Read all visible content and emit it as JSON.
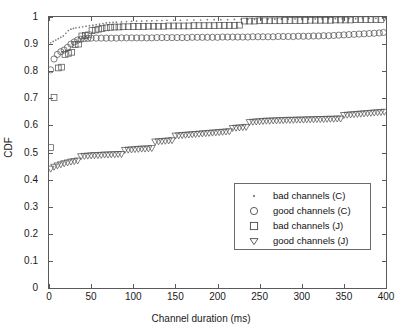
{
  "chart_data": {
    "type": "scatter",
    "title": "",
    "xlabel": "Channel duration (ms)",
    "ylabel": "CDF",
    "xlim": [
      0,
      400
    ],
    "ylim": [
      0,
      1
    ],
    "xticks": [
      0,
      50,
      100,
      150,
      200,
      250,
      300,
      350,
      400
    ],
    "yticks": [
      0,
      0.1,
      0.2,
      0.3,
      0.4,
      0.5,
      0.6,
      0.7,
      0.8,
      0.9,
      1
    ],
    "xtick_labels": [
      "0",
      "50",
      "100",
      "150",
      "200",
      "250",
      "300",
      "350",
      "400"
    ],
    "ytick_labels": [
      "0",
      "0.1",
      "0.2",
      "0.3",
      "0.4",
      "0.5",
      "0.6",
      "0.7",
      "0.8",
      "0.9",
      "1"
    ],
    "grid": false,
    "legend_position": "lower right",
    "series": [
      {
        "name": "bad channels (C)",
        "marker": "dot",
        "color": "#7a7a7a",
        "x": [
          2,
          5,
          8,
          11,
          14,
          17,
          20,
          23,
          26,
          29,
          32,
          36,
          40,
          44,
          48,
          52,
          56,
          60,
          64,
          68,
          72,
          76,
          80,
          86,
          92,
          98,
          104,
          110,
          116,
          122,
          128,
          134,
          140,
          148,
          156,
          164,
          172,
          180,
          188,
          196,
          204,
          212,
          220,
          228,
          236,
          244,
          252,
          260,
          268,
          276,
          284,
          292,
          300,
          308,
          316,
          324,
          332,
          340,
          348,
          356,
          364,
          372,
          380,
          388,
          396
        ],
        "y": [
          0.905,
          0.91,
          0.915,
          0.92,
          0.925,
          0.93,
          0.94,
          0.95,
          0.955,
          0.958,
          0.96,
          0.962,
          0.964,
          0.966,
          0.968,
          0.97,
          0.972,
          0.974,
          0.976,
          0.978,
          0.979,
          0.98,
          0.981,
          0.982,
          0.983,
          0.984,
          0.985,
          0.985,
          0.986,
          0.986,
          0.987,
          0.987,
          0.988,
          0.988,
          0.988,
          0.989,
          0.989,
          0.989,
          0.99,
          0.99,
          0.99,
          0.99,
          0.991,
          0.991,
          0.991,
          0.991,
          0.992,
          0.992,
          0.992,
          0.992,
          0.992,
          0.993,
          0.993,
          0.993,
          0.993,
          0.993,
          0.994,
          0.994,
          0.994,
          0.994,
          0.994,
          0.995,
          0.995,
          0.995,
          0.996
        ]
      },
      {
        "name": "good channels (C)",
        "marker": "circle",
        "color": "#4a4a4a",
        "x": [
          2,
          6,
          10,
          14,
          18,
          22,
          26,
          30,
          34,
          38,
          42,
          46,
          50,
          56,
          62,
          68,
          74,
          80,
          86,
          92,
          98,
          104,
          110,
          116,
          122,
          128,
          134,
          140,
          146,
          152,
          158,
          164,
          170,
          176,
          182,
          188,
          194,
          200,
          206,
          212,
          218,
          224,
          230,
          236,
          242,
          248,
          254,
          260,
          266,
          272,
          278,
          284,
          290,
          296,
          302,
          308,
          314,
          320,
          326,
          332,
          338,
          344,
          350,
          356,
          362,
          368,
          374,
          380,
          386,
          392,
          397
        ],
        "y": [
          0.805,
          0.845,
          0.862,
          0.872,
          0.878,
          0.888,
          0.9,
          0.908,
          0.915,
          0.918,
          0.92,
          0.921,
          0.922,
          0.922,
          0.922,
          0.922,
          0.922,
          0.922,
          0.923,
          0.923,
          0.923,
          0.923,
          0.923,
          0.923,
          0.923,
          0.924,
          0.924,
          0.924,
          0.924,
          0.924,
          0.924,
          0.924,
          0.925,
          0.925,
          0.925,
          0.925,
          0.925,
          0.925,
          0.926,
          0.926,
          0.926,
          0.926,
          0.926,
          0.926,
          0.927,
          0.927,
          0.927,
          0.927,
          0.927,
          0.928,
          0.928,
          0.928,
          0.928,
          0.929,
          0.929,
          0.929,
          0.93,
          0.93,
          0.931,
          0.931,
          0.932,
          0.933,
          0.934,
          0.935,
          0.936,
          0.937,
          0.938,
          0.939,
          0.94,
          0.941,
          0.943
        ]
      },
      {
        "name": "bad channels (J)",
        "marker": "square",
        "color": "#4a4a4a",
        "x": [
          2,
          6,
          11,
          15,
          19,
          23,
          27,
          31,
          35,
          39,
          43,
          47,
          51,
          55,
          59,
          63,
          68,
          73,
          78,
          83,
          88,
          94,
          100,
          106,
          112,
          118,
          124,
          130,
          136,
          142,
          148,
          154,
          160,
          166,
          172,
          178,
          184,
          190,
          196,
          202,
          208,
          214,
          220,
          226,
          232,
          238,
          244,
          250,
          256,
          262,
          268,
          274,
          280,
          286,
          292,
          298,
          304,
          310,
          316,
          322,
          328,
          334,
          340,
          346,
          352,
          358,
          364,
          370,
          376,
          382,
          388,
          394
        ],
        "y": [
          0.518,
          0.703,
          0.812,
          0.815,
          0.862,
          0.866,
          0.87,
          0.898,
          0.9,
          0.93,
          0.932,
          0.934,
          0.95,
          0.952,
          0.955,
          0.958,
          0.96,
          0.962,
          0.963,
          0.963,
          0.964,
          0.964,
          0.965,
          0.965,
          0.965,
          0.966,
          0.966,
          0.966,
          0.966,
          0.967,
          0.967,
          0.967,
          0.967,
          0.967,
          0.968,
          0.968,
          0.968,
          0.968,
          0.968,
          0.969,
          0.969,
          0.969,
          0.969,
          0.97,
          0.985,
          0.985,
          0.985,
          0.986,
          0.986,
          0.986,
          0.986,
          0.986,
          0.987,
          0.987,
          0.987,
          0.987,
          0.987,
          0.988,
          0.988,
          0.988,
          0.988,
          0.988,
          0.989,
          0.989,
          0.989,
          0.989,
          0.99,
          0.99,
          0.99,
          0.99,
          0.99,
          0.991
        ]
      },
      {
        "name": "good channels (J)",
        "marker": "triangle-down",
        "color": "#4a4a4a",
        "x": [
          2,
          6,
          10,
          14,
          18,
          22,
          26,
          30,
          34,
          38,
          42,
          46,
          50,
          54,
          58,
          62,
          66,
          70,
          74,
          78,
          82,
          86,
          90,
          94,
          98,
          102,
          106,
          110,
          114,
          118,
          122,
          126,
          130,
          134,
          138,
          142,
          146,
          150,
          154,
          158,
          162,
          166,
          170,
          174,
          178,
          182,
          186,
          190,
          194,
          198,
          202,
          206,
          210,
          214,
          218,
          222,
          226,
          230,
          234,
          238,
          242,
          246,
          250,
          254,
          258,
          262,
          266,
          270,
          274,
          278,
          282,
          286,
          290,
          294,
          298,
          302,
          306,
          310,
          314,
          318,
          322,
          326,
          330,
          334,
          338,
          342,
          346,
          350,
          354,
          358,
          362,
          366,
          370,
          374,
          378,
          382,
          386,
          390,
          394,
          398
        ],
        "y": [
          0.44,
          0.447,
          0.452,
          0.456,
          0.46,
          0.463,
          0.466,
          0.468,
          0.47,
          0.486,
          0.487,
          0.488,
          0.489,
          0.49,
          0.49,
          0.491,
          0.492,
          0.492,
          0.493,
          0.493,
          0.494,
          0.494,
          0.509,
          0.51,
          0.511,
          0.512,
          0.513,
          0.514,
          0.514,
          0.515,
          0.516,
          0.54,
          0.541,
          0.542,
          0.543,
          0.544,
          0.545,
          0.562,
          0.563,
          0.564,
          0.565,
          0.566,
          0.567,
          0.568,
          0.569,
          0.57,
          0.571,
          0.572,
          0.573,
          0.574,
          0.575,
          0.576,
          0.577,
          0.578,
          0.59,
          0.591,
          0.592,
          0.593,
          0.594,
          0.612,
          0.613,
          0.614,
          0.615,
          0.616,
          0.617,
          0.617,
          0.618,
          0.618,
          0.619,
          0.619,
          0.62,
          0.62,
          0.62,
          0.621,
          0.621,
          0.621,
          0.622,
          0.622,
          0.622,
          0.623,
          0.623,
          0.623,
          0.624,
          0.624,
          0.624,
          0.625,
          0.625,
          0.638,
          0.639,
          0.64,
          0.641,
          0.642,
          0.643,
          0.644,
          0.645,
          0.646,
          0.647,
          0.648,
          0.649,
          0.65
        ]
      },
      {
        "name": "good channels (J) endpoint",
        "marker": "triangle-down",
        "color": "#4a4a4a",
        "x": [
          398
        ],
        "y": [
          0.998
        ]
      }
    ],
    "legend": [
      {
        "label": "bad channels (C)",
        "marker": "dot"
      },
      {
        "label": "good channels (C)",
        "marker": "circle"
      },
      {
        "label": "bad channels (J)",
        "marker": "square"
      },
      {
        "label": "good channels (J)",
        "marker": "triangle-down"
      }
    ]
  },
  "colors": {
    "axis": "#5a5a5a",
    "marker": "#4a4a4a",
    "dot": "#7a7a7a",
    "background": "#ffffff"
  }
}
